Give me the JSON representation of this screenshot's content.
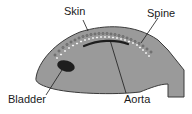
{
  "diagram": {
    "type": "anatomical cross-section of a fish-like embryo",
    "labels": {
      "skin": "Skin",
      "spine": "Spine",
      "bladder": "Bladder",
      "aorta": "Aorta"
    },
    "colors": {
      "body_fill": "#9a9a9a",
      "outline": "#3a3a3a",
      "bladder_fill": "#1e1e1e",
      "aorta_stroke": "#1e1e1e",
      "vertebra_fill": "#ffffff",
      "text": "#1a1a1a"
    }
  }
}
